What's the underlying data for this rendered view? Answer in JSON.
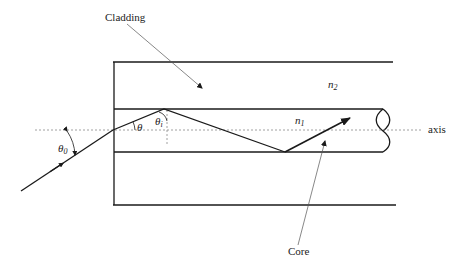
{
  "diagram": {
    "labels": {
      "cladding": "Cladding",
      "core": "Core",
      "axis": "axis",
      "n2": "n",
      "n2_sub": "2",
      "n1": "n",
      "n1_sub": "1",
      "theta": "θ",
      "theta_i": "θ",
      "theta_i_sub": "i",
      "theta_0": "θ",
      "theta_0_sub": "0"
    },
    "colors": {
      "line": "#1a1a1a",
      "dashed": "#888888",
      "text": "#222222",
      "background": "#ffffff"
    }
  }
}
